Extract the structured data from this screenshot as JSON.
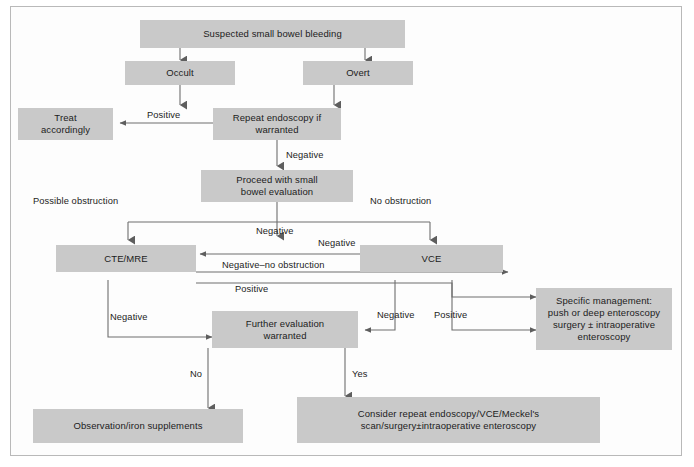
{
  "figure": {
    "box_fill": "#c9c9c9",
    "line_color": "#6e6e6e",
    "text_color": "#1c1c1c",
    "frame_color": "#b9b9b9",
    "width": 694,
    "height": 467
  },
  "nodes": {
    "suspected": {
      "label": "Suspected small bowel bleeding"
    },
    "occult": {
      "label": "Occult"
    },
    "overt": {
      "label": "Overt"
    },
    "treat_accordingly": {
      "label": "Treat\naccordingly",
      "line1": "Treat",
      "line2": "accordingly"
    },
    "repeat_endoscopy": {
      "label": "Repeat endoscopy if\nwarranted",
      "line1": "Repeat endoscopy if",
      "line2": "warranted"
    },
    "proceed_evaluation": {
      "label": "Proceed with small\nbowel evaluation",
      "line1": "Proceed with small",
      "line2": "bowel evaluation"
    },
    "cte_mre": {
      "label": "CTE/MRE"
    },
    "vce": {
      "label": "VCE"
    },
    "further_evaluation": {
      "label": "Further evaluation\nwarranted",
      "line1": "Further evaluation",
      "line2": "warranted"
    },
    "specific_management": {
      "line1": "Specific management:",
      "line2": "push or deep enteroscopy",
      "line3": "surgery ± intraoperative",
      "line4": "enteroscopy"
    },
    "observation": {
      "label": "Observation/iron supplements"
    },
    "consider_repeat": {
      "line1": "Consider repeat endoscopy/VCE/Meckel's",
      "line2": "scan/surgery±intraoperative enteroscopy"
    }
  },
  "edge_labels": {
    "positive_to_treat": "Positive",
    "negative_to_proceed": "Negative",
    "possible_obstruction": "Possible obstruction",
    "no_obstruction": "No obstruction",
    "negative_branch": "Negative",
    "negative_vce_to_cte": "Negative",
    "negative_no_obstruction": "Negative–no obstruction",
    "positive_cte_to_mgmt": "Positive",
    "negative_cte_to_further": "Negative",
    "negative_vce_to_further": "Negative",
    "positive_vce_to_mgmt": "Positive",
    "no_branch": "No",
    "yes_branch": "Yes"
  }
}
